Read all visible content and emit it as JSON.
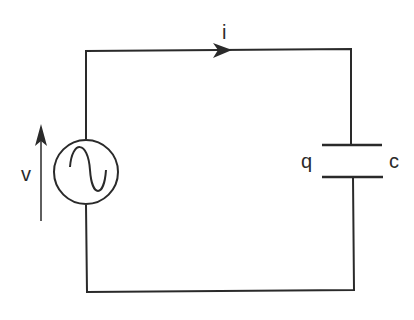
{
  "diagram": {
    "labels": {
      "current": "i",
      "voltage": "v",
      "charge": "q",
      "capacitance": "c"
    },
    "components": [
      {
        "type": "ac-voltage-source",
        "label": "v"
      },
      {
        "type": "capacitor",
        "labels": [
          "q",
          "c"
        ]
      }
    ],
    "stroke_color": "#2a2a2a"
  }
}
